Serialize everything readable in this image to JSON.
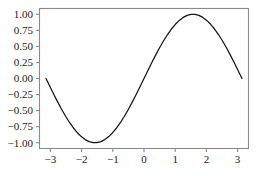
{
  "chart_data": {
    "type": "line",
    "title": "",
    "subtitle": "",
    "xlabel": "",
    "ylabel": "",
    "xlim": [
      -3.35,
      3.35
    ],
    "ylim": [
      -1.09,
      1.09
    ],
    "grid": false,
    "legend": null,
    "legend_position": "none",
    "line_color": "#141414",
    "axis_color": "#8a8a8a",
    "background_color": "#ffffff",
    "xticks": [
      -3,
      -2,
      -1,
      0,
      1,
      2,
      3
    ],
    "xticklabels": [
      "−3",
      "−2",
      "−1",
      "0",
      "1",
      "2",
      "3"
    ],
    "yticks": [
      -1.0,
      -0.75,
      -0.5,
      -0.25,
      0.0,
      0.25,
      0.5,
      0.75,
      1.0
    ],
    "yticklabels": [
      "−1.00",
      "−0.75",
      "−0.50",
      "−0.25",
      "0.00",
      "0.25",
      "0.50",
      "0.75",
      "1.00"
    ],
    "series": [
      {
        "name": "sin(x)",
        "x": [
          -3.14159,
          -3.01592,
          -2.89026,
          -2.7646,
          -2.63894,
          -2.51327,
          -2.38761,
          -2.26195,
          -2.13628,
          -2.01062,
          -1.88496,
          -1.75929,
          -1.63363,
          -1.50796,
          -1.3823,
          -1.25664,
          -1.13097,
          -1.00531,
          -0.87965,
          -0.75398,
          -0.62832,
          -0.50265,
          -0.37699,
          -0.25133,
          -0.12566,
          0.0,
          0.12566,
          0.25133,
          0.37699,
          0.50265,
          0.62832,
          0.75398,
          0.87965,
          1.00531,
          1.13097,
          1.25664,
          1.3823,
          1.50796,
          1.63363,
          1.75929,
          1.88496,
          2.01062,
          2.13628,
          2.26195,
          2.38761,
          2.51327,
          2.63894,
          2.7646,
          2.89026,
          3.01592,
          3.14159
        ],
        "y": [
          0.0,
          -0.12533,
          -0.24869,
          -0.36812,
          -0.48175,
          -0.58779,
          -0.68455,
          -0.77051,
          -0.84433,
          -0.90483,
          -0.95106,
          -0.98229,
          -0.99803,
          -0.99803,
          -0.98229,
          -0.95106,
          -0.90483,
          -0.84433,
          -0.77051,
          -0.68455,
          -0.58779,
          -0.48175,
          -0.36812,
          -0.24869,
          -0.12533,
          0.0,
          0.12533,
          0.24869,
          0.36812,
          0.48175,
          0.58779,
          0.68455,
          0.77051,
          0.84433,
          0.90483,
          0.95106,
          0.98229,
          0.99803,
          0.99803,
          0.98229,
          0.95106,
          0.90483,
          0.84433,
          0.77051,
          0.68455,
          0.58779,
          0.48175,
          0.36812,
          0.24869,
          0.12533,
          0.0
        ]
      }
    ]
  }
}
